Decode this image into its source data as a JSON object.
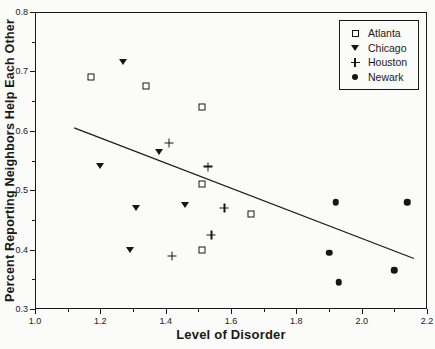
{
  "colors": {
    "ink": "#1a1a1a",
    "background": "#fbfbf9"
  },
  "chart_data": {
    "type": "scatter",
    "title": "",
    "xlabel": "Level of Disorder",
    "ylabel": "Percent Reporting Neighbors Help Each Other",
    "xlim": [
      1.0,
      2.2
    ],
    "ylim": [
      0.3,
      0.8
    ],
    "grid": false,
    "legend_position": "upper-right-inside",
    "x_major_ticks": [
      1.0,
      1.2,
      1.4,
      1.6,
      1.8,
      2.0,
      2.2
    ],
    "x_tick_labels": [
      "1.0",
      "1.2",
      "1.4",
      "1.6",
      "1.8",
      "2.0",
      "2.2"
    ],
    "x_minor_ticks": [
      1.1,
      1.3,
      1.5,
      1.7,
      1.9,
      2.1
    ],
    "y_major_ticks": [
      0.3,
      0.4,
      0.5,
      0.6,
      0.7,
      0.8
    ],
    "y_tick_labels": [
      "0.3",
      "0.4",
      "0.5",
      "0.6",
      "0.7",
      "0.8"
    ],
    "y_minor_ticks": [
      0.35,
      0.45,
      0.55,
      0.65,
      0.75
    ],
    "series": [
      {
        "name": "Atlanta",
        "marker": "open-square",
        "points": [
          [
            1.17,
            0.69
          ],
          [
            1.34,
            0.675
          ],
          [
            1.51,
            0.64
          ],
          [
            1.51,
            0.51
          ],
          [
            1.66,
            0.46
          ],
          [
            1.51,
            0.4
          ]
        ]
      },
      {
        "name": "Chicago",
        "marker": "filled-triangle-down",
        "points": [
          [
            1.27,
            0.715
          ],
          [
            1.2,
            0.54
          ],
          [
            1.38,
            0.565
          ],
          [
            1.31,
            0.47
          ],
          [
            1.46,
            0.475
          ],
          [
            1.29,
            0.4
          ]
        ]
      },
      {
        "name": "Houston",
        "marker": "plus",
        "points": [
          [
            1.41,
            0.58
          ],
          [
            1.53,
            0.555
          ],
          [
            1.58,
            0.5
          ],
          [
            1.54,
            0.47
          ],
          [
            1.42,
            0.45
          ]
        ]
      },
      {
        "name": "Newark",
        "marker": "filled-circle",
        "points": [
          [
            1.92,
            0.48
          ],
          [
            2.14,
            0.48
          ],
          [
            1.9,
            0.395
          ],
          [
            1.93,
            0.345
          ],
          [
            2.1,
            0.365
          ]
        ]
      }
    ],
    "trend_line": {
      "x1": 1.12,
      "y1": 0.605,
      "x2": 2.16,
      "y2": 0.385
    }
  }
}
